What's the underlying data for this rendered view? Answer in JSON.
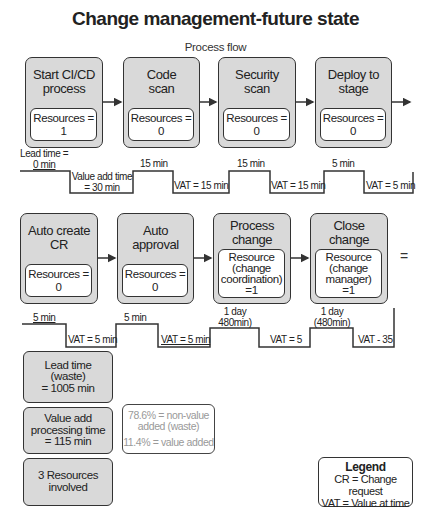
{
  "title": "Change management-future state",
  "subtitle": "Process flow",
  "row1": {
    "steps": [
      {
        "title_line1": "Start CI/CD",
        "title_line2": "process",
        "resource": "Resources = 1"
      },
      {
        "title_line1": "Code",
        "title_line2": "scan",
        "resource": "Resources = 0"
      },
      {
        "title_line1": "Security",
        "title_line2": "scan",
        "resource": "Resources = 0"
      },
      {
        "title_line1": "Deploy to",
        "title_line2": "stage",
        "resource": "Resources = 0"
      }
    ],
    "timeline": {
      "lead_time_line1": "Lead time =",
      "lead_time_line2": "0 min",
      "vat_first_line1": "Value add time",
      "vat_first_line2": "= 30 min",
      "wait_labels": [
        "15 min",
        "15 min",
        "5 min"
      ],
      "vat_labels": [
        "VAT = 15 min",
        "VAT = 15 min",
        "VAT = 5 min"
      ]
    }
  },
  "row2": {
    "steps": [
      {
        "title_line1": "Auto create",
        "title_line2": "CR",
        "resource": "Resources = 0"
      },
      {
        "title_line1": "Auto",
        "title_line2": "approval",
        "resource": "Resources = 0"
      },
      {
        "title_line1": "Process",
        "title_line2": "change",
        "resource_line1": "Resource",
        "resource_line2": "(change",
        "resource_line3": "coordination)",
        "resource_line4": "=1"
      },
      {
        "title_line1": "Close",
        "title_line2": "change",
        "resource_line1": "Resource",
        "resource_line2": "(change",
        "resource_line3": "manager)",
        "resource_line4": "=1"
      }
    ],
    "equals_sign": "=",
    "timeline": {
      "wait_labels": [
        "5 min",
        "5 min"
      ],
      "wait_day_labels": [
        {
          "line1": "1 day",
          "line2": "480min)"
        },
        {
          "line1": "1 day",
          "line2": "(480min)"
        }
      ],
      "vat_labels": [
        "VAT = 5 min",
        "VAT = 5 min",
        "VAT = 5",
        "VAT - 35"
      ]
    }
  },
  "summary": {
    "lead_time": {
      "line1": "Lead time",
      "line2": "(waste)",
      "line3": "= 1005 min"
    },
    "value_add": {
      "line1": "Value add",
      "line2": "processing time",
      "line3": "= 115 min"
    },
    "resources": {
      "line1": "3 Resources",
      "line2": "involved"
    },
    "percent": {
      "line1": "78.6% = non-value",
      "line2": "added (waste)",
      "line3": "11.4% = value added"
    }
  },
  "legend": {
    "title": "Legend",
    "items": [
      "CR = Change request",
      "VAT = Value at time"
    ]
  },
  "colors": {
    "box_fill": "#d9d9d9",
    "border": "#333333",
    "muted_text": "#999999"
  }
}
